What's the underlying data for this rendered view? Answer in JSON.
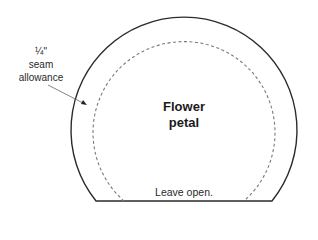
{
  "diagram": {
    "title_line1": "Flower",
    "title_line2": "petal",
    "seam_label": {
      "line1": "¼\"",
      "line2": "seam",
      "line3": "allowance"
    },
    "bottom_label": "Leave open.",
    "colors": {
      "outline": "#2b2b2b",
      "dashed": "#7a7a7a",
      "arrow": "#555555",
      "background": "#ffffff"
    }
  }
}
